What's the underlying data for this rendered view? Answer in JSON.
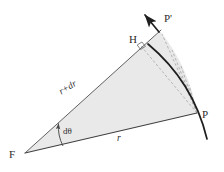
{
  "figure": {
    "background_color": "#ffffff",
    "stroke_color": "#3a3a3a",
    "fill_color": "#e9e9e9",
    "dashed_color": "#a8a8a8",
    "arc_color": "#1f1f1f",
    "labels": {
      "focus": "F",
      "point_p": "P",
      "point_p_prime": "P'",
      "foot_h": "H",
      "radius": "r",
      "radius_plus_dr": "r+dr",
      "angle_element": "dθ"
    },
    "points": {
      "F": {
        "x": 25,
        "y": 153
      },
      "P": {
        "x": 197,
        "y": 113
      },
      "P_prime": {
        "x": 160,
        "y": 31
      },
      "H": {
        "x": 141,
        "y": 46
      }
    },
    "elements": [
      {
        "name": "shaded-sector",
        "type": "polygon-arc",
        "fill": "#e9e9e9"
      },
      {
        "name": "radius-line-FP",
        "type": "line",
        "label": "r"
      },
      {
        "name": "radius-line-FP-prime",
        "type": "line",
        "label": "r+dr"
      },
      {
        "name": "orbit-arc",
        "type": "arc"
      },
      {
        "name": "velocity-arrow",
        "type": "arrow"
      },
      {
        "name": "right-angle-marker",
        "type": "square-tick"
      },
      {
        "name": "angle-arc-dtheta",
        "type": "arc-arrow"
      },
      {
        "name": "dashed-fan",
        "type": "dashed-lines",
        "count": 4
      }
    ]
  }
}
